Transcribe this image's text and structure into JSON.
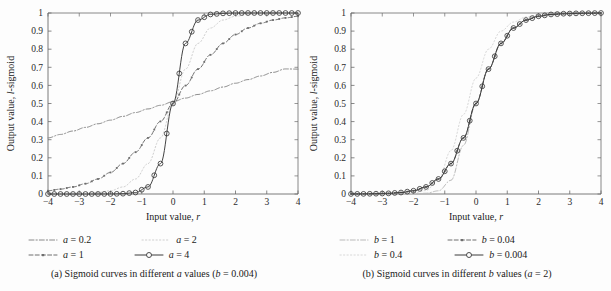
{
  "figure": {
    "background": "#fdfdfd",
    "panels": [
      {
        "id": "a",
        "caption_prefix": "(a)",
        "caption_text_1": "Sigmoid curves in different",
        "caption_em_1": "a",
        "caption_text_2": "values (",
        "caption_em_2": "b",
        "caption_text_3": " = 0.004)",
        "xlabel_text": "Input value,",
        "xlabel_em": "r",
        "ylabel_text": "Output value,",
        "ylabel_em": "l",
        "ylabel_text_2": "-sigmoid",
        "legend": [
          {
            "label_em": "a",
            "label_text": " = 0.2",
            "style": "dashdot",
            "marker": "none",
            "color": "#8a8a8a"
          },
          {
            "label_em": "a",
            "label_text": " = 2",
            "style": "dotted",
            "marker": "none",
            "color": "#cfcfcf"
          },
          {
            "label_em": "a",
            "label_text": " = 1",
            "style": "dashed",
            "marker": "dot",
            "color": "#6e6e6e"
          },
          {
            "label_em": "a",
            "label_text": " = 4",
            "style": "solid",
            "marker": "circle",
            "color": "#3a3a3a"
          }
        ]
      },
      {
        "id": "b",
        "caption_prefix": "(b)",
        "caption_text_1": "Sigmoid curves in different",
        "caption_em_1": "b",
        "caption_text_2": "values (",
        "caption_em_2": "a",
        "caption_text_3": " = 2)",
        "xlabel_text": "Input value,",
        "xlabel_em": "r",
        "ylabel_text": "Output value,",
        "ylabel_em": "l",
        "ylabel_text_2": "-sigmoid",
        "legend": [
          {
            "label_em": "b",
            "label_text": " = 1",
            "style": "dashdot",
            "marker": "none",
            "color": "#b9b9b9"
          },
          {
            "label_em": "b",
            "label_text": " = 0.04",
            "style": "dashed",
            "marker": "dot",
            "color": "#6e6e6e"
          },
          {
            "label_em": "b",
            "label_text": " = 0.4",
            "style": "dotted",
            "marker": "none",
            "color": "#d8d8d8"
          },
          {
            "label_em": "b",
            "label_text": " = 0.004",
            "style": "solid",
            "marker": "circle",
            "color": "#3a3a3a"
          }
        ]
      }
    ]
  },
  "chart_data": [
    {
      "type": "line",
      "title": "(a) Sigmoid curves in different a values (b = 0.004)",
      "xlabel": "Input value, r",
      "ylabel": "Output value, l-sigmoid",
      "xlim": [
        -4,
        4
      ],
      "ylim": [
        0,
        1
      ],
      "xticks": [
        -4,
        -3,
        -2,
        -1,
        0,
        1,
        2,
        3,
        4
      ],
      "yticks": [
        0,
        0.1,
        0.2,
        0.3,
        0.4,
        0.5,
        0.6,
        0.7,
        0.8,
        0.9,
        1
      ],
      "grid": false,
      "legend_position": "below",
      "x": [
        -4,
        -3.6,
        -3.2,
        -2.8,
        -2.4,
        -2,
        -1.6,
        -1.2,
        -0.8,
        -0.4,
        0,
        0.4,
        0.8,
        1.2,
        1.6,
        2,
        2.4,
        2.8,
        3.2,
        3.6,
        4
      ],
      "series": [
        {
          "name": "a = 0.2",
          "a": 0.2,
          "b": 0.004,
          "style": "dashdot",
          "marker": "none",
          "color": "#8a8a8a",
          "values": [
            0.31,
            0.329,
            0.348,
            0.368,
            0.388,
            0.408,
            0.429,
            0.45,
            0.47,
            0.49,
            0.51,
            0.53,
            0.55,
            0.57,
            0.591,
            0.612,
            0.632,
            0.652,
            0.672,
            0.691,
            0.69
          ]
        },
        {
          "name": "a = 1",
          "a": 1,
          "b": 0.004,
          "style": "dashed",
          "marker": "dot",
          "color": "#6e6e6e",
          "values": [
            0.018,
            0.027,
            0.039,
            0.057,
            0.083,
            0.119,
            0.168,
            0.231,
            0.31,
            0.401,
            0.5,
            0.599,
            0.69,
            0.769,
            0.832,
            0.881,
            0.917,
            0.943,
            0.961,
            0.973,
            0.982
          ]
        },
        {
          "name": "a = 2",
          "a": 2,
          "b": 0.004,
          "style": "dotted",
          "marker": "none",
          "color": "#cfcfcf",
          "values": [
            0.0003,
            0.0007,
            0.0017,
            0.0037,
            0.0082,
            0.018,
            0.039,
            0.083,
            0.168,
            0.31,
            0.5,
            0.69,
            0.832,
            0.917,
            0.961,
            0.982,
            0.992,
            0.996,
            0.998,
            0.999,
            1.0
          ]
        },
        {
          "name": "a = 4",
          "a": 4,
          "b": 0.004,
          "style": "solid",
          "marker": "circle",
          "color": "#3a3a3a",
          "values": [
            0.0,
            0.0,
            0.0,
            0.0,
            0.0001,
            0.0003,
            0.0017,
            0.0082,
            0.039,
            0.168,
            0.5,
            0.832,
            0.961,
            0.992,
            0.998,
            1.0,
            1.0,
            1.0,
            1.0,
            1.0,
            1.0
          ]
        }
      ]
    },
    {
      "type": "line",
      "title": "(b) Sigmoid curves in different b values (a = 2)",
      "xlabel": "Input value, r",
      "ylabel": "Output value, l-sigmoid",
      "xlim": [
        -4,
        4
      ],
      "ylim": [
        0,
        1
      ],
      "xticks": [
        -4,
        -3,
        -2,
        -1,
        0,
        1,
        2,
        3,
        4
      ],
      "yticks": [
        0,
        0.1,
        0.2,
        0.3,
        0.4,
        0.5,
        0.6,
        0.7,
        0.8,
        0.9,
        1
      ],
      "grid": false,
      "legend_position": "below",
      "x": [
        -4,
        -3.6,
        -3.2,
        -2.8,
        -2.4,
        -2,
        -1.6,
        -1.2,
        -0.8,
        -0.4,
        0,
        0.4,
        0.8,
        1.2,
        1.6,
        2,
        2.4,
        2.8,
        3.2,
        3.6,
        4
      ],
      "series": [
        {
          "name": "b = 1",
          "a": 2,
          "b": 1,
          "style": "dashdot",
          "marker": "none",
          "color": "#b9b9b9",
          "values": [
            0.0,
            0.0,
            0.0,
            0.0001,
            0.0002,
            0.0009,
            0.004,
            0.0177,
            0.0759,
            0.2689,
            0.5,
            0.69,
            0.832,
            0.917,
            0.961,
            0.982,
            0.992,
            0.996,
            0.998,
            0.999,
            1.0
          ]
        },
        {
          "name": "b = 0.4",
          "a": 2,
          "b": 0.4,
          "style": "dotted",
          "marker": "none",
          "color": "#d8d8d8",
          "values": [
            0.0,
            0.0,
            0.0001,
            0.0003,
            0.001,
            0.0044,
            0.019,
            0.08,
            0.24,
            0.44,
            0.64,
            0.8,
            0.9,
            0.95,
            0.978,
            0.99,
            0.996,
            0.998,
            0.999,
            1.0,
            1.0
          ]
        },
        {
          "name": "b = 0.04",
          "a": 2,
          "b": 0.04,
          "style": "dashed",
          "marker": "dot",
          "color": "#6e6e6e",
          "values": [
            0.0003,
            0.0007,
            0.0017,
            0.0037,
            0.0082,
            0.018,
            0.039,
            0.083,
            0.168,
            0.31,
            0.5,
            0.69,
            0.832,
            0.917,
            0.961,
            0.982,
            0.992,
            0.996,
            0.998,
            0.999,
            1.0
          ]
        },
        {
          "name": "b = 0.004",
          "a": 2,
          "b": 0.004,
          "style": "solid",
          "marker": "circle",
          "color": "#3a3a3a",
          "values": [
            0.0003,
            0.0007,
            0.0017,
            0.0037,
            0.0082,
            0.018,
            0.039,
            0.083,
            0.168,
            0.31,
            0.5,
            0.69,
            0.832,
            0.917,
            0.961,
            0.982,
            0.992,
            0.996,
            0.998,
            0.999,
            1.0
          ]
        }
      ]
    }
  ]
}
